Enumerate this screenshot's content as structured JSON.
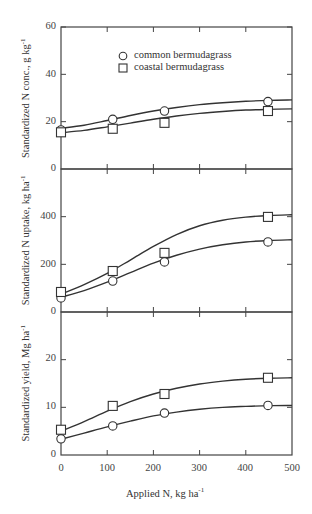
{
  "chart_data": [
    {
      "type": "line",
      "title": "",
      "xlabel": "Applied N, kg ha-1",
      "ylabel": "Standardized N conc., g kg-1",
      "ylabel_main": "Standardized N conc., g kg",
      "ylabel_sup": "-1",
      "ylim": [
        0,
        60
      ],
      "xlim": [
        0,
        500
      ],
      "yticks": [
        0,
        20,
        40,
        60
      ],
      "ytick_labels": [
        "0",
        "20",
        "40",
        "60"
      ],
      "legend": [
        "common bermudagrass",
        "coastal bermudagrass"
      ],
      "legend_position": "upper center",
      "grid": false,
      "x": [
        0,
        112,
        224,
        448
      ],
      "series": [
        {
          "name": "common bermudagrass",
          "marker": "circle",
          "values": [
            16.5,
            21.0,
            24.5,
            28.5
          ],
          "curve": [
            [
              0,
              17.2
            ],
            [
              50,
              18.5
            ],
            [
              100,
              20.5
            ],
            [
              150,
              22.6
            ],
            [
              200,
              24.5
            ],
            [
              250,
              26.0
            ],
            [
              300,
              27.2
            ],
            [
              350,
              28.0
            ],
            [
              400,
              28.6
            ],
            [
              450,
              29.0
            ],
            [
              500,
              29.2
            ]
          ]
        },
        {
          "name": "coastal bermudagrass",
          "marker": "square",
          "values": [
            15.5,
            17.0,
            19.5,
            24.5
          ],
          "curve": [
            [
              0,
              15.3
            ],
            [
              50,
              16.3
            ],
            [
              100,
              17.8
            ],
            [
              150,
              19.4
            ],
            [
              200,
              21.0
            ],
            [
              250,
              22.4
            ],
            [
              300,
              23.5
            ],
            [
              350,
              24.3
            ],
            [
              400,
              24.9
            ],
            [
              450,
              25.2
            ],
            [
              500,
              25.4
            ]
          ]
        }
      ]
    },
    {
      "type": "line",
      "title": "",
      "xlabel": "Applied N, kg ha-1",
      "ylabel": "Standardized N uptake, kg ha-1",
      "ylabel_main": "Standardized N uptake, kg ha",
      "ylabel_sup": "-1",
      "ylim": [
        0,
        600
      ],
      "xlim": [
        0,
        500
      ],
      "yticks": [
        0,
        200,
        400
      ],
      "ytick_labels": [
        "0",
        "200",
        "400"
      ],
      "grid": false,
      "x": [
        0,
        112,
        224,
        448
      ],
      "series": [
        {
          "name": "common bermudagrass",
          "marker": "circle",
          "values": [
            59,
            130,
            210,
            294
          ],
          "curve": [
            [
              0,
              62
            ],
            [
              50,
              90
            ],
            [
              100,
              125
            ],
            [
              150,
              165
            ],
            [
              200,
              205
            ],
            [
              250,
              238
            ],
            [
              300,
              264
            ],
            [
              350,
              282
            ],
            [
              400,
              294
            ],
            [
              450,
              300
            ],
            [
              500,
              303
            ]
          ]
        },
        {
          "name": "coastal bermudagrass",
          "marker": "square",
          "values": [
            84,
            172,
            248,
            399
          ],
          "curve": [
            [
              0,
              75
            ],
            [
              50,
              115
            ],
            [
              100,
              162
            ],
            [
              150,
              218
            ],
            [
              200,
              275
            ],
            [
              250,
              325
            ],
            [
              300,
              362
            ],
            [
              350,
              385
            ],
            [
              400,
              398
            ],
            [
              450,
              405
            ],
            [
              500,
              408
            ]
          ]
        }
      ]
    },
    {
      "type": "line",
      "title": "",
      "xlabel": "Applied N, kg ha-1",
      "ylabel": "Standardized yield, Mg ha-1",
      "ylabel_main": "Standardized yield, Mg ha",
      "ylabel_sup": "-1",
      "ylim": [
        0,
        30
      ],
      "xlim": [
        0,
        500
      ],
      "yticks": [
        0,
        10,
        20
      ],
      "ytick_labels": [
        "0",
        "10",
        "20"
      ],
      "xticks": [
        0,
        100,
        200,
        300,
        400,
        500
      ],
      "xtick_labels": [
        "0",
        "100",
        "200",
        "300",
        "400",
        "500"
      ],
      "grid": false,
      "x": [
        0,
        112,
        224,
        448
      ],
      "series": [
        {
          "name": "common bermudagrass",
          "marker": "circle",
          "values": [
            3.4,
            6.1,
            8.8,
            10.4
          ],
          "curve": [
            [
              0,
              3.3
            ],
            [
              50,
              4.6
            ],
            [
              100,
              5.9
            ],
            [
              150,
              7.1
            ],
            [
              200,
              8.2
            ],
            [
              250,
              9.0
            ],
            [
              300,
              9.6
            ],
            [
              350,
              10.0
            ],
            [
              400,
              10.2
            ],
            [
              450,
              10.35
            ],
            [
              500,
              10.4
            ]
          ]
        },
        {
          "name": "coastal bermudagrass",
          "marker": "square",
          "values": [
            5.3,
            10.3,
            12.8,
            16.2
          ],
          "curve": [
            [
              0,
              5.0
            ],
            [
              50,
              7.0
            ],
            [
              100,
              9.2
            ],
            [
              150,
              11.2
            ],
            [
              200,
              12.8
            ],
            [
              250,
              14.0
            ],
            [
              300,
              14.9
            ],
            [
              350,
              15.5
            ],
            [
              400,
              15.9
            ],
            [
              450,
              16.1
            ],
            [
              500,
              16.2
            ]
          ]
        }
      ]
    }
  ],
  "x_axis": {
    "label_main": "Applied N, kg ha",
    "label_sup": "-1",
    "tick_labels": [
      "0",
      "100",
      "200",
      "300",
      "400",
      "500"
    ]
  },
  "legend": {
    "items": [
      {
        "label": "common bermudagrass",
        "marker": "circle"
      },
      {
        "label": "coastal bermudagrass",
        "marker": "square"
      }
    ]
  },
  "colors": {
    "line": "#333333",
    "axis": "#444444",
    "background": "#ffffff"
  }
}
